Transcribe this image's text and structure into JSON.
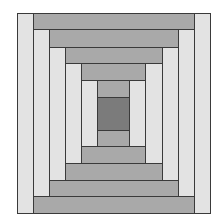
{
  "colors": {
    "light": "#e3e3e3",
    "medium": "#a9a9a9",
    "center": "#7b7b7b",
    "border": "#3a3a3a"
  },
  "rings": {
    "x_edges": [
      17,
      33,
      49,
      65,
      81,
      97
    ],
    "x_edges_right": [
      210,
      194,
      178,
      162,
      145,
      129
    ],
    "y_edges": [
      13,
      29,
      47,
      63,
      80,
      97
    ],
    "y_edges_bottom": [
      213,
      196,
      180,
      163,
      146,
      130
    ]
  },
  "center": {
    "x": 97,
    "y": 97,
    "w": 32,
    "h": 33
  }
}
